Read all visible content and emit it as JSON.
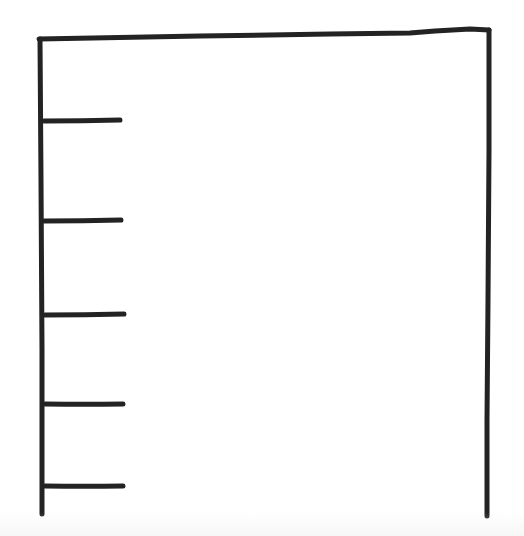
{
  "canvas": {
    "width": 524,
    "height": 536,
    "background": "#ffffff",
    "ink_color": "#232323",
    "stroke_width": 5
  },
  "frame": {
    "description": "hand-drawn open-bottom frame (wireframe panel)",
    "top_edge": {
      "x1": 39,
      "y1": 39,
      "x2": 489,
      "y2": 30
    },
    "left_edge": {
      "x1": 41,
      "y1": 39,
      "x2": 42,
      "y2": 514
    },
    "right_edge": {
      "x1": 489,
      "y1": 30,
      "x2": 487,
      "y2": 516
    }
  },
  "list_items": [
    {
      "index": 1,
      "label": "",
      "x1": 44,
      "y1": 121,
      "x2": 120,
      "y2": 120
    },
    {
      "index": 2,
      "label": "",
      "x1": 44,
      "y1": 221,
      "x2": 121,
      "y2": 220
    },
    {
      "index": 3,
      "label": "",
      "x1": 45,
      "y1": 315,
      "x2": 124,
      "y2": 314
    },
    {
      "index": 4,
      "label": "",
      "x1": 45,
      "y1": 404,
      "x2": 123,
      "y2": 404
    },
    {
      "index": 5,
      "label": "",
      "x1": 45,
      "y1": 486,
      "x2": 123,
      "y2": 486
    }
  ]
}
